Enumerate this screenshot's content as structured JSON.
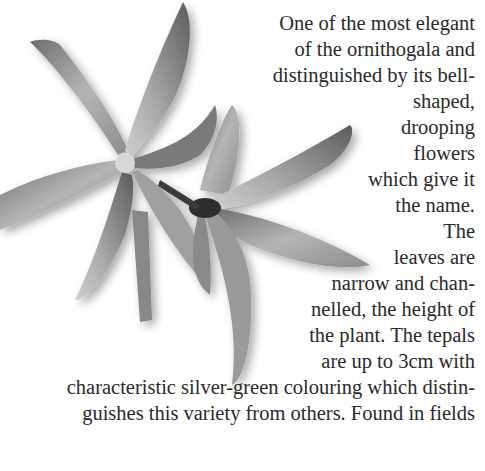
{
  "text": {
    "lines": [
      "One of the most elegant",
      "of the ornithogala and",
      "distinguished by its bell-",
      "shaped,",
      "drooping",
      "flowers",
      "which give it",
      "the name.",
      "The",
      "leaves are",
      "narrow and chan-",
      "nelled, the height of",
      "the plant. The tepals",
      "are up to 3cm with",
      "characteristic silver-green colouring which distin-",
      "guishes this variety from others. Found in fields"
    ]
  },
  "colors": {
    "text": "#2a2a2a",
    "background": "#ffffff"
  }
}
